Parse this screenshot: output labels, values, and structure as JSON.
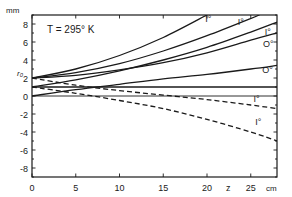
{
  "chart_data": {
    "type": "line",
    "title": "",
    "annotation": "T = 295° K",
    "xlabel": "z",
    "xunit": "cm",
    "ylabel": "r0",
    "yunit": "mm",
    "xlim": [
      0,
      28
    ],
    "ylim": [
      -9,
      9
    ],
    "xticks": [
      0,
      5,
      10,
      15,
      20,
      25
    ],
    "xtick_labels": [
      "0",
      "5",
      "10",
      "15",
      "20",
      "25"
    ],
    "yticks": [
      -8,
      -6,
      -4,
      -2,
      0,
      2,
      4,
      6,
      8
    ],
    "ytick_labels": [
      "-8",
      "-6",
      "-4",
      "-2",
      "0",
      "2",
      "4",
      "6",
      "8"
    ],
    "grid": false,
    "series": [
      {
        "name": "I° (a)",
        "style": "solid",
        "label_pos": [
          19.8,
          8.2
        ],
        "x": [
          0,
          5,
          10,
          15,
          20
        ],
        "y": [
          2.0,
          3.0,
          4.5,
          6.5,
          9.0
        ]
      },
      {
        "name": "I° (b)",
        "style": "solid",
        "label_pos": [
          23.5,
          7.9
        ],
        "x": [
          0,
          5,
          10,
          15,
          20,
          26
        ],
        "y": [
          2.0,
          2.6,
          3.6,
          5.0,
          6.7,
          9.0
        ]
      },
      {
        "name": "I° (c)",
        "style": "solid",
        "label_pos": [
          26.6,
          6.8
        ],
        "x": [
          0,
          5,
          10,
          15,
          20,
          25,
          28
        ],
        "y": [
          1.0,
          1.8,
          2.8,
          4.0,
          5.4,
          7.1,
          8.2
        ]
      },
      {
        "name": "O° (a)",
        "style": "solid",
        "label_pos": [
          26.4,
          5.4
        ],
        "x": [
          0,
          5,
          10,
          15,
          20,
          25,
          28
        ],
        "y": [
          2.0,
          2.3,
          2.9,
          3.7,
          4.8,
          6.2,
          7.0
        ]
      },
      {
        "name": "O° (b)",
        "style": "solid",
        "label_pos": [
          26.3,
          2.6
        ],
        "x": [
          0,
          5,
          10,
          15,
          20,
          25,
          28
        ],
        "y": [
          0.0,
          0.7,
          1.3,
          1.9,
          2.4,
          3.0,
          3.4
        ]
      },
      {
        "name": "baseline",
        "style": "solid",
        "x": [
          0,
          28
        ],
        "y": [
          1.0,
          1.0
        ]
      },
      {
        "name": "I° (d)",
        "style": "dashed",
        "label_pos": [
          25.3,
          -0.7
        ],
        "x": [
          0,
          5,
          10,
          15,
          20,
          25,
          28
        ],
        "y": [
          2.0,
          1.2,
          0.6,
          0.1,
          -0.4,
          -1.0,
          -1.4
        ]
      },
      {
        "name": "I° (e)",
        "style": "dashed",
        "label_pos": [
          25.5,
          -3.2
        ],
        "x": [
          0,
          5,
          10,
          15,
          20,
          25,
          28
        ],
        "y": [
          1.0,
          0.3,
          -0.5,
          -1.4,
          -2.6,
          -4.0,
          -5.0
        ]
      },
      {
        "name": "zero-line",
        "style": "solid-thin",
        "x": [
          0,
          28
        ],
        "y": [
          0.0,
          0.0
        ]
      }
    ]
  },
  "labels": {
    "annotation": "T = 295° K",
    "y_unit": "mm",
    "y_symbol": "r₀",
    "x_symbol": "z",
    "x_unit": "cm"
  }
}
